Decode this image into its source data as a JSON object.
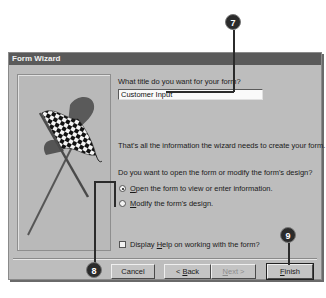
{
  "window": {
    "title": "Form Wizard"
  },
  "wizard": {
    "title_prompt": "What title do you want for your form?",
    "title_value": "Customer Input",
    "info_text": "That's all the information the wizard needs to create your form.",
    "open_prompt": "Do you want to open the form or modify the form's design?",
    "options": [
      {
        "accel": "O",
        "rest": "pen the form to view or enter information.",
        "selected": true
      },
      {
        "accel": "M",
        "rest": "odify the form's design.",
        "selected": false
      }
    ],
    "help_checkbox": {
      "pre": "Display ",
      "accel": "H",
      "rest": "elp on working with the form?",
      "checked": false
    },
    "illustration": "checkered-flag-icon"
  },
  "buttons": {
    "cancel": "Cancel",
    "back": {
      "pre": "< ",
      "accel": "B",
      "rest": "ack"
    },
    "next": {
      "accel": "N",
      "rest": "ext >"
    },
    "finish": {
      "accel": "F",
      "rest": "inish"
    }
  },
  "callouts": [
    "7",
    "8",
    "9"
  ]
}
